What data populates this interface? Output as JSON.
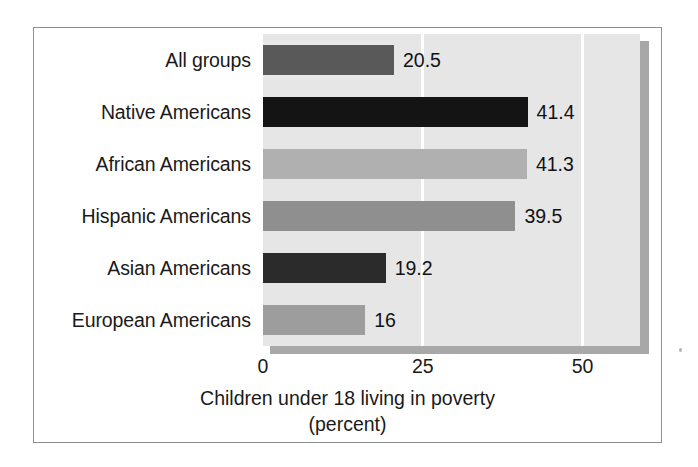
{
  "chart_data": {
    "type": "bar",
    "orientation": "horizontal",
    "title": "",
    "xlabel": "Children under 18 living in poverty",
    "xlabel_line2": "(percent)",
    "ylabel": "",
    "categories": [
      "All groups",
      "Native Americans",
      "African Americans",
      "Hispanic Americans",
      "Asian Americans",
      "European Americans"
    ],
    "values": [
      20.5,
      41.4,
      41.3,
      39.5,
      19.2,
      16
    ],
    "value_labels": [
      "20.5",
      "41.4",
      "41.3",
      "39.5",
      "19.2",
      "16"
    ],
    "bar_colors": [
      "#595959",
      "#141414",
      "#b0b0b0",
      "#8f8f8f",
      "#2b2b2b",
      "#9d9d9d"
    ],
    "xlim": [
      0,
      59
    ],
    "xticks": [
      0,
      25,
      50
    ],
    "xtick_labels": [
      "0",
      "25",
      "50"
    ],
    "grid": true,
    "gridline_color": "#ffffff",
    "plot_background": "#e6e6e6",
    "legend": "none"
  },
  "figure": {
    "frame_color": "#8e8e8e",
    "shadow_color": "#a8a8a8",
    "page_background": "#ffffff"
  }
}
